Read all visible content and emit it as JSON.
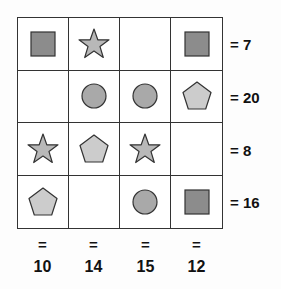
{
  "puzzle": {
    "colors": {
      "square": "#8c8c8c",
      "circle": "#a9a9a9",
      "star": "#b8b8b8",
      "pentagon": "#cccccc",
      "stroke": "#333333"
    },
    "grid": [
      [
        "square",
        "star",
        "",
        "square"
      ],
      [
        "",
        "circle",
        "circle",
        "pentagon"
      ],
      [
        "star",
        "pentagon",
        "star",
        ""
      ],
      [
        "pentagon",
        "",
        "circle",
        "square"
      ]
    ],
    "row_sums": [
      "= 7",
      "= 20",
      "= 8",
      "= 16"
    ],
    "col_eq": [
      "=",
      "=",
      "=",
      "="
    ],
    "col_sums": [
      "10",
      "14",
      "15",
      "12"
    ]
  }
}
